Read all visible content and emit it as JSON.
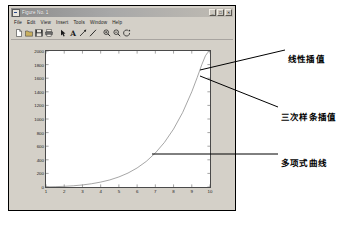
{
  "window": {
    "title": "Figure No. 1",
    "icon": "matlab-figure-icon",
    "buttons": [
      {
        "name": "minimize-button",
        "glyph": "_"
      },
      {
        "name": "maximize-button",
        "glyph": "□"
      },
      {
        "name": "close-button",
        "glyph": "✕"
      }
    ]
  },
  "menu": {
    "items": [
      {
        "name": "menu-file",
        "label": "File"
      },
      {
        "name": "menu-edit",
        "label": "Edit"
      },
      {
        "name": "menu-view",
        "label": "View"
      },
      {
        "name": "menu-insert",
        "label": "Insert"
      },
      {
        "name": "menu-tools",
        "label": "Tools"
      },
      {
        "name": "menu-window",
        "label": "Window"
      },
      {
        "name": "menu-help",
        "label": "Help"
      }
    ]
  },
  "toolbar": {
    "items": [
      {
        "name": "new-figure-icon",
        "type": "page"
      },
      {
        "name": "open-file-icon",
        "type": "folder"
      },
      {
        "name": "save-icon",
        "type": "disk"
      },
      {
        "name": "print-icon",
        "type": "printer"
      },
      {
        "name": "edit-plot-arrow-icon",
        "type": "arrow"
      },
      {
        "name": "insert-text-icon",
        "type": "text-a"
      },
      {
        "name": "insert-arrow-icon",
        "type": "annot-arrow"
      },
      {
        "name": "insert-line-icon",
        "type": "annot-line"
      },
      {
        "name": "zoom-in-icon",
        "type": "zoom-in"
      },
      {
        "name": "zoom-out-icon",
        "type": "zoom-out"
      },
      {
        "name": "rotate-3d-icon",
        "type": "rotate"
      }
    ]
  },
  "chart_data": {
    "type": "line",
    "title": "",
    "xlabel": "",
    "ylabel": "",
    "xlim": [
      1,
      10
    ],
    "ylim": [
      0,
      2000
    ],
    "grid": false,
    "xticks": [
      1,
      2,
      3,
      4,
      5,
      6,
      7,
      8,
      9,
      10
    ],
    "xticklabels": [
      "1",
      "2",
      "3",
      "4",
      "5",
      "6",
      "7",
      "8",
      "9",
      "10"
    ],
    "yticks": [
      0,
      200,
      400,
      600,
      800,
      1000,
      1200,
      1400,
      1600,
      1800,
      2000
    ],
    "yticklabels": [
      "0",
      "200",
      "400",
      "600",
      "800",
      "1000",
      "1200",
      "1400",
      "1600",
      "1800",
      "2000"
    ],
    "series": [
      {
        "name": "多项式曲线",
        "color": "#808080",
        "x": [
          1.0,
          1.5,
          2.0,
          2.5,
          3.0,
          3.5,
          4.0,
          4.5,
          5.0,
          5.5,
          6.0,
          6.5,
          7.0,
          7.5,
          8.0,
          8.5,
          9.0,
          9.3,
          9.55,
          9.75,
          9.88,
          9.95,
          10.0
        ],
        "y": [
          2,
          5,
          10,
          18,
          30,
          48,
          72,
          104,
          148,
          205,
          280,
          376,
          500,
          656,
          852,
          1096,
          1400,
          1612,
          1800,
          1930,
          1980,
          1996,
          2000
        ]
      }
    ],
    "annotations": [
      {
        "name": "annotation-linear-interp",
        "label": "线性插值",
        "text_x": 288,
        "text_y": 52,
        "leader_from": [
          285,
          50
        ],
        "leader_to": [
          200,
          70
        ]
      },
      {
        "name": "annotation-cubic-spline",
        "label": "三次样条插值",
        "text_x": 281,
        "text_y": 110,
        "leader_from": [
          278,
          107
        ],
        "leader_to": [
          200,
          76
        ]
      },
      {
        "name": "annotation-polynomial-curve",
        "label": "多项式曲线",
        "text_x": 281,
        "text_y": 156,
        "leader_from": [
          278,
          154
        ],
        "leader_to": [
          152,
          154
        ]
      }
    ]
  }
}
